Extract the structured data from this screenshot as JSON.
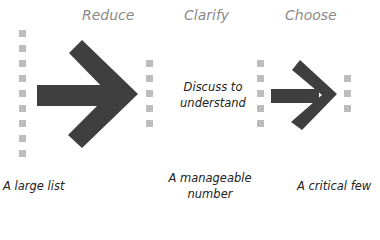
{
  "stages": [
    {
      "title": "Reduce"
    },
    {
      "title": "Clarify",
      "note_line1": "Discuss to",
      "note_line2": "understand"
    },
    {
      "title": "Choose"
    }
  ],
  "labels": {
    "left": "A large list",
    "middle_line1": "A manageable",
    "middle_line2": "number",
    "right": "A critical few"
  },
  "colors": {
    "arrow": "#3f3f3f",
    "square": "#bdbdbd",
    "title": "#8a8a8a",
    "text": "#222222"
  },
  "counts": {
    "large_list_items": 9,
    "manageable_items": 5,
    "critical_few_items": 3
  }
}
